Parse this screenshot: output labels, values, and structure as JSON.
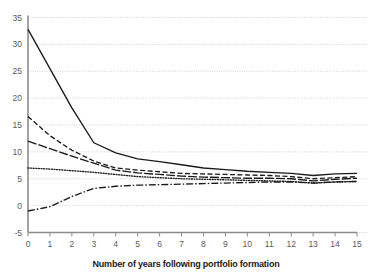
{
  "chart_data": {
    "type": "line",
    "title": "",
    "subtitle": "",
    "xlabel": "Number of years following portfolio formation",
    "ylabel": "",
    "xlim": [
      0,
      15
    ],
    "ylim": [
      -5,
      35
    ],
    "grid": true,
    "grid_axis": "y",
    "grid_style": "dotted",
    "grid_color": "#c8c8c8",
    "legend": "none",
    "legend_position": "none",
    "x": [
      0,
      1,
      2,
      3,
      4,
      5,
      6,
      7,
      8,
      9,
      10,
      11,
      12,
      13,
      14,
      15
    ],
    "xticks": [
      "0",
      "1",
      "2",
      "3",
      "4",
      "5",
      "6",
      "7",
      "8",
      "9",
      "10",
      "11",
      "12",
      "13",
      "14",
      "15"
    ],
    "yticks": [
      "-5",
      "0",
      "5",
      "10",
      "15",
      "20",
      "25",
      "30",
      "35"
    ],
    "ytick_values": [
      -5,
      0,
      5,
      10,
      15,
      20,
      25,
      30,
      35
    ],
    "line_color": "#1a1a1a",
    "series": [
      {
        "name": "series-solid",
        "style": "solid",
        "dasharray": "",
        "values": [
          32.8,
          25.5,
          18.2,
          11.7,
          9.8,
          8.7,
          8.2,
          7.6,
          7.0,
          6.7,
          6.4,
          6.2,
          6.0,
          5.6,
          5.9,
          6.0
        ]
      },
      {
        "name": "series-dashed",
        "style": "dashed",
        "dasharray": "5,2.5",
        "values": [
          16.6,
          13.0,
          10.3,
          8.3,
          7.0,
          6.6,
          6.3,
          6.0,
          5.9,
          5.8,
          5.7,
          5.6,
          5.4,
          5.0,
          5.2,
          5.4
        ]
      },
      {
        "name": "series-long-dash",
        "style": "long-dash",
        "dasharray": "9,2",
        "values": [
          12.0,
          10.6,
          9.2,
          7.9,
          6.6,
          6.1,
          5.8,
          5.5,
          5.3,
          5.2,
          5.1,
          5.1,
          5.0,
          4.6,
          4.9,
          5.1
        ]
      },
      {
        "name": "series-dotted",
        "style": "dotted",
        "dasharray": "1,1.6",
        "values": [
          7.0,
          6.8,
          6.5,
          6.2,
          5.8,
          5.4,
          5.2,
          5.0,
          4.9,
          4.8,
          4.7,
          4.6,
          4.5,
          4.2,
          4.4,
          4.5
        ]
      },
      {
        "name": "series-dash-dot",
        "style": "dash-dot",
        "dasharray": "7,2,1.5,2",
        "values": [
          -1.0,
          -0.2,
          1.7,
          3.2,
          3.6,
          3.8,
          3.9,
          4.0,
          4.1,
          4.2,
          4.3,
          4.4,
          4.4,
          4.2,
          4.4,
          4.5
        ]
      }
    ]
  },
  "axis": {
    "xlabel": "Number of years following portfolio formation"
  }
}
